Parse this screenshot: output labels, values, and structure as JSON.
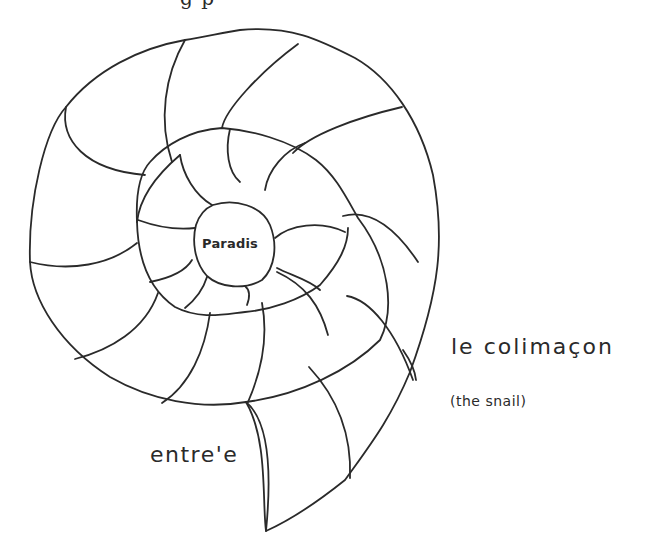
{
  "figure": {
    "type": "hand-drawn spiral diagram",
    "stroke_color": "#2a2a2a",
    "background_color": "#ffffff"
  },
  "labels": {
    "center": "Paradis",
    "title": "le colimaçon",
    "translation": "(the snail)",
    "entrance": "entre'e"
  },
  "cropped_top_text": "g p"
}
